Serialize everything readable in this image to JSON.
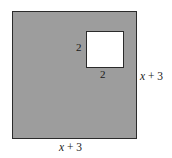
{
  "figure": {
    "type": "geometry-diagram",
    "canvas": {
      "width": 172,
      "height": 158,
      "background": "#ffffff"
    },
    "outer_square": {
      "name": "outer-square",
      "fill": "#9d9d9d",
      "stroke": "#2b2b2b",
      "side_label": "x + 3",
      "side_label_var": "x",
      "side_label_rest": " + 3"
    },
    "inner_square": {
      "name": "inner-square",
      "fill": "#ffffff",
      "stroke": "#2b2b2b",
      "side_label": "2"
    },
    "labels": {
      "inner_left": "2",
      "inner_bottom": "2",
      "outer_right_var": "x",
      "outer_right_rest": " + 3",
      "outer_bottom_var": "x",
      "outer_bottom_rest": " + 3"
    }
  }
}
